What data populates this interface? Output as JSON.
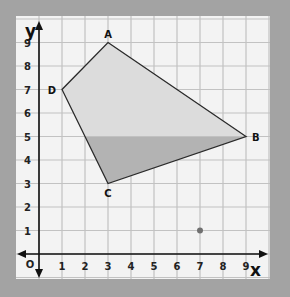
{
  "figure": {
    "type": "coordinate-grid",
    "x_axis_label": "x",
    "y_axis_label": "y",
    "origin_label": "O",
    "x_ticks": [
      "1",
      "2",
      "3",
      "4",
      "5",
      "6",
      "7",
      "8",
      "9"
    ],
    "y_ticks": [
      "1",
      "2",
      "3",
      "4",
      "5",
      "6",
      "7",
      "8",
      "9"
    ],
    "xlim": [
      -1,
      10
    ],
    "ylim": [
      -1,
      10
    ],
    "grid": true,
    "colors": {
      "background": "#a3a3a3",
      "panel": "#f3f3f3",
      "grid": "#c2c2c2",
      "shape_upper": "#dcdcdc",
      "shape_lower": "#b3b3b3",
      "outline": "#2a2a2a",
      "point": "#707070"
    }
  },
  "shape": {
    "name": "quadrilateral ABCD",
    "vertices": [
      {
        "label": "A",
        "x": 3,
        "y": 9
      },
      {
        "label": "B",
        "x": 9,
        "y": 5
      },
      {
        "label": "C",
        "x": 3,
        "y": 3
      },
      {
        "label": "D",
        "x": 1,
        "y": 7
      }
    ],
    "shading_split_y": 5
  },
  "points": [
    {
      "label": "",
      "x": 7,
      "y": 1
    }
  ]
}
